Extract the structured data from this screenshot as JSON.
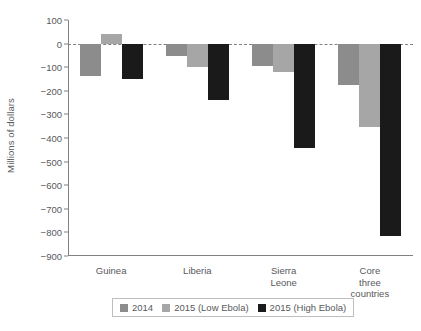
{
  "chart_data": {
    "type": "bar",
    "title": "",
    "subtitle": "",
    "xlabel": "",
    "ylabel": "Millions of dollars",
    "ylim": [
      -900,
      100
    ],
    "ytick_step": 100,
    "yticks": [
      100,
      0,
      -100,
      -200,
      -300,
      -400,
      -500,
      -600,
      -700,
      -800,
      -900
    ],
    "ytick_labels": [
      "100",
      "0",
      "−100",
      "−200",
      "−300",
      "−400",
      "−500",
      "−600",
      "−700",
      "−800",
      "−900"
    ],
    "categories": [
      "Guinea",
      "Liberia",
      "Sierra Leone",
      "Core three countries"
    ],
    "category_labels": [
      "Guinea",
      "Liberia",
      "Sierra Leone",
      "Core three\ncountries"
    ],
    "grid": false,
    "zero_line": true,
    "legend_position": "bottom",
    "series": [
      {
        "name": "2014",
        "color": "#8c8c8c",
        "values": [
          -139,
          -52,
          -95,
          -176
        ]
      },
      {
        "name": "2015 (Low Ebola)",
        "color": "#a6a6a6",
        "values": [
          40,
          -100,
          -122,
          -355
        ]
      },
      {
        "name": "2015 (High Ebola)",
        "color": "#1a1a1a",
        "values": [
          -150,
          -240,
          -442,
          -817
        ]
      }
    ]
  },
  "legend": {
    "entries": [
      {
        "label": "2014",
        "color": "#8c8c8c"
      },
      {
        "label": "2015 (Low Ebola)",
        "color": "#a6a6a6"
      },
      {
        "label": "2015 (High Ebola)",
        "color": "#1a1a1a"
      }
    ]
  },
  "colors": {
    "axis": "#808285",
    "text": "#58595b",
    "background": "#ffffff",
    "legend_border": "#bcbec0"
  }
}
